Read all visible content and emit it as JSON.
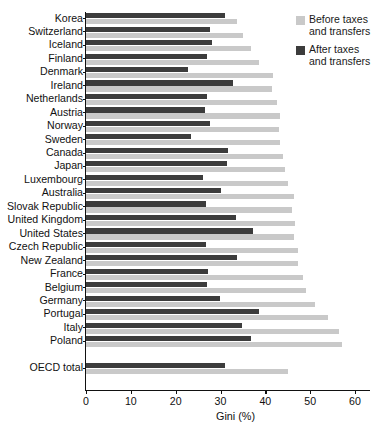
{
  "chart_data": {
    "type": "bar",
    "orientation": "horizontal",
    "title": "",
    "xlabel": "Gini (%)",
    "ylabel": "",
    "xlim": [
      0,
      60
    ],
    "xticks": [
      0,
      10,
      20,
      30,
      40,
      50,
      60
    ],
    "grid": false,
    "legend_position": "top-right",
    "categories": [
      "Korea",
      "Switzerland",
      "Iceland",
      "Finland",
      "Denmark",
      "Ireland",
      "Netherlands",
      "Austria",
      "Norway",
      "Sweden",
      "Canada",
      "Japan",
      "Luxembourg",
      "Australia",
      "Slovak Republic",
      "United Kingdom",
      "United States",
      "Czech Republic",
      "New Zealand",
      "France",
      "Belgium",
      "Germany",
      "Portugal",
      "Italy",
      "Poland",
      "",
      "OECD total"
    ],
    "series": [
      {
        "name": "Before taxes and transfers",
        "color": "#c9c9c9",
        "values": [
          33.7,
          35.0,
          36.8,
          38.6,
          41.7,
          41.5,
          42.6,
          43.3,
          43.0,
          43.2,
          44.0,
          44.3,
          45.0,
          46.3,
          46.0,
          46.6,
          46.4,
          47.3,
          47.3,
          48.5,
          49.0,
          51.0,
          54.0,
          56.5,
          57.0,
          null,
          45.0
        ]
      },
      {
        "name": "After taxes and transfers",
        "color": "#3c3c3c",
        "values": [
          31.0,
          27.6,
          28.0,
          26.9,
          22.8,
          32.8,
          27.1,
          26.5,
          27.6,
          23.4,
          31.7,
          31.4,
          26.0,
          30.1,
          26.8,
          33.5,
          37.2,
          26.8,
          33.7,
          27.3,
          27.1,
          29.8,
          38.5,
          34.7,
          36.7,
          null,
          31.0
        ]
      }
    ]
  },
  "legend": {
    "entries": [
      {
        "label": "Before taxes\nand transfers",
        "swatch": "before"
      },
      {
        "label": "After taxes\nand transfers",
        "swatch": "after"
      }
    ]
  }
}
